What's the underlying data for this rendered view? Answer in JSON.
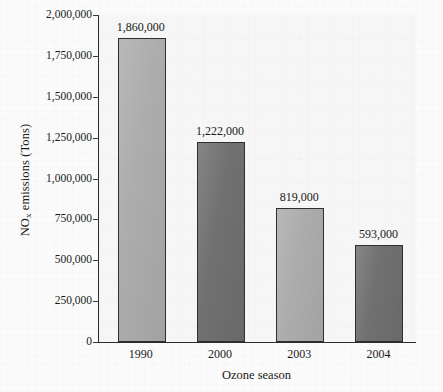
{
  "chart_data": {
    "type": "bar",
    "title": "",
    "subtitle": "",
    "xlabel": "Ozone season",
    "ylabel": "NO",
    "ylabel_subscript": "x",
    "ylabel_suffix": " emissions (Tons)",
    "categories": [
      "1990",
      "2000",
      "2003",
      "2004"
    ],
    "values": [
      1860000,
      1222000,
      819000,
      593000
    ],
    "data_labels": [
      "1,860,000",
      "1,222,000",
      "819,000",
      "593,000"
    ],
    "ylim": [
      0,
      2000000
    ],
    "ytick_values": [
      0,
      250000,
      500000,
      750000,
      1000000,
      1250000,
      1500000,
      1750000,
      2000000
    ],
    "ytick_labels": [
      "0",
      "250,000",
      "500,000",
      "750,000",
      "1,000,000",
      "1,250,000",
      "1,500,000",
      "1,750,000",
      "2,000,000"
    ],
    "grid": false,
    "legend": "none",
    "bar_colors": [
      "#ababab",
      "#6e6e6e",
      "#ababab",
      "#6e6e6e"
    ],
    "bar_edge_color": "#2f2f2f",
    "axis_color": "#2b2b2b",
    "plot_background": "#f6f6f6",
    "page_background": "#fbfbfb"
  }
}
